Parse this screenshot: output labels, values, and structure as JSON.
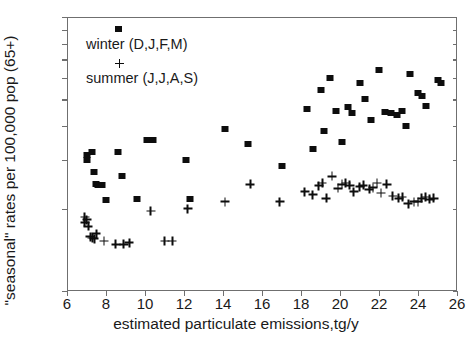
{
  "chart_data": {
    "type": "scatter",
    "title": "",
    "xlabel": "estimated particulate emissions,tg/y",
    "ylabel": "\"seasonal\" rates per 100,000 pop (65+)",
    "xlim": [
      6,
      26
    ],
    "ylim": [
      100,
      1000
    ],
    "yscale": "log",
    "xscale": "linear",
    "grid": false,
    "xticks": [
      6,
      8,
      10,
      12,
      14,
      16,
      18,
      20,
      22,
      24,
      26
    ],
    "xticklabels": [
      "6",
      "8",
      "10",
      "12",
      "14",
      "16",
      "18",
      "20",
      "22",
      "24",
      "26"
    ],
    "yticks": [
      100,
      200,
      300,
      400,
      500,
      600,
      700,
      800,
      900,
      1000
    ],
    "yticklabels": [
      "100",
      "",
      "",
      "",
      "",
      "",
      "",
      "",
      "",
      "1000"
    ],
    "legend_position": "upper-left-inside",
    "series": [
      {
        "name": "winter (D,J,F,M)",
        "marker": "square",
        "color": "#0d0d0d",
        "points": [
          [
            7.0,
            313
          ],
          [
            7.0,
            300
          ],
          [
            7.3,
            322
          ],
          [
            7.4,
            272
          ],
          [
            7.5,
            246
          ],
          [
            7.6,
            243
          ],
          [
            7.8,
            243
          ],
          [
            8.0,
            215
          ],
          [
            8.6,
            322
          ],
          [
            8.8,
            262
          ],
          [
            9.6,
            216
          ],
          [
            10.1,
            355
          ],
          [
            10.4,
            357
          ],
          [
            12.1,
            300
          ],
          [
            12.3,
            216
          ],
          [
            14.1,
            390
          ],
          [
            15.3,
            345
          ],
          [
            17.0,
            285
          ],
          [
            18.3,
            460
          ],
          [
            18.6,
            330
          ],
          [
            19.0,
            540
          ],
          [
            19.2,
            385
          ],
          [
            19.5,
            600
          ],
          [
            19.8,
            455
          ],
          [
            20.1,
            350
          ],
          [
            20.4,
            470
          ],
          [
            20.6,
            445
          ],
          [
            21.0,
            575
          ],
          [
            21.3,
            500
          ],
          [
            21.6,
            420
          ],
          [
            22.0,
            640
          ],
          [
            22.3,
            450
          ],
          [
            22.6,
            448
          ],
          [
            22.9,
            440
          ],
          [
            23.2,
            455
          ],
          [
            23.4,
            400
          ],
          [
            23.6,
            620
          ],
          [
            24.0,
            530
          ],
          [
            24.2,
            515
          ],
          [
            24.4,
            475
          ],
          [
            25.0,
            590
          ],
          [
            25.2,
            575
          ]
        ]
      },
      {
        "name": "summer (J,J,A,S)",
        "marker": "plus",
        "color": "#0d0d0d",
        "points": [
          [
            6.9,
            186
          ],
          [
            6.9,
            178
          ],
          [
            7.0,
            182
          ],
          [
            7.1,
            172
          ],
          [
            7.2,
            158
          ],
          [
            7.3,
            156
          ],
          [
            7.4,
            155
          ],
          [
            7.5,
            162
          ],
          [
            7.9,
            152
          ],
          [
            8.5,
            148
          ],
          [
            8.9,
            148
          ],
          [
            9.2,
            150
          ],
          [
            10.3,
            196
          ],
          [
            11.0,
            152
          ],
          [
            11.4,
            152
          ],
          [
            12.2,
            200
          ],
          [
            14.1,
            212
          ],
          [
            15.4,
            245
          ],
          [
            16.9,
            212
          ],
          [
            18.2,
            230
          ],
          [
            18.6,
            225
          ],
          [
            18.9,
            242
          ],
          [
            19.1,
            248
          ],
          [
            19.3,
            218
          ],
          [
            19.6,
            262
          ],
          [
            19.9,
            237
          ],
          [
            20.1,
            245
          ],
          [
            20.3,
            248
          ],
          [
            20.5,
            243
          ],
          [
            20.7,
            230
          ],
          [
            21.0,
            240
          ],
          [
            21.2,
            243
          ],
          [
            21.5,
            235
          ],
          [
            21.7,
            238
          ],
          [
            21.9,
            248
          ],
          [
            22.1,
            228
          ],
          [
            22.4,
            245
          ],
          [
            22.7,
            222
          ],
          [
            23.0,
            218
          ],
          [
            23.2,
            220
          ],
          [
            23.5,
            208
          ],
          [
            23.8,
            212
          ],
          [
            24.0,
            212
          ],
          [
            24.2,
            218
          ],
          [
            24.4,
            220
          ],
          [
            24.6,
            216
          ],
          [
            24.8,
            218
          ]
        ]
      }
    ]
  },
  "legend": {
    "winter_label": "winter (D,J,F,M)",
    "summer_label": "summer (J,J,A,S)"
  }
}
